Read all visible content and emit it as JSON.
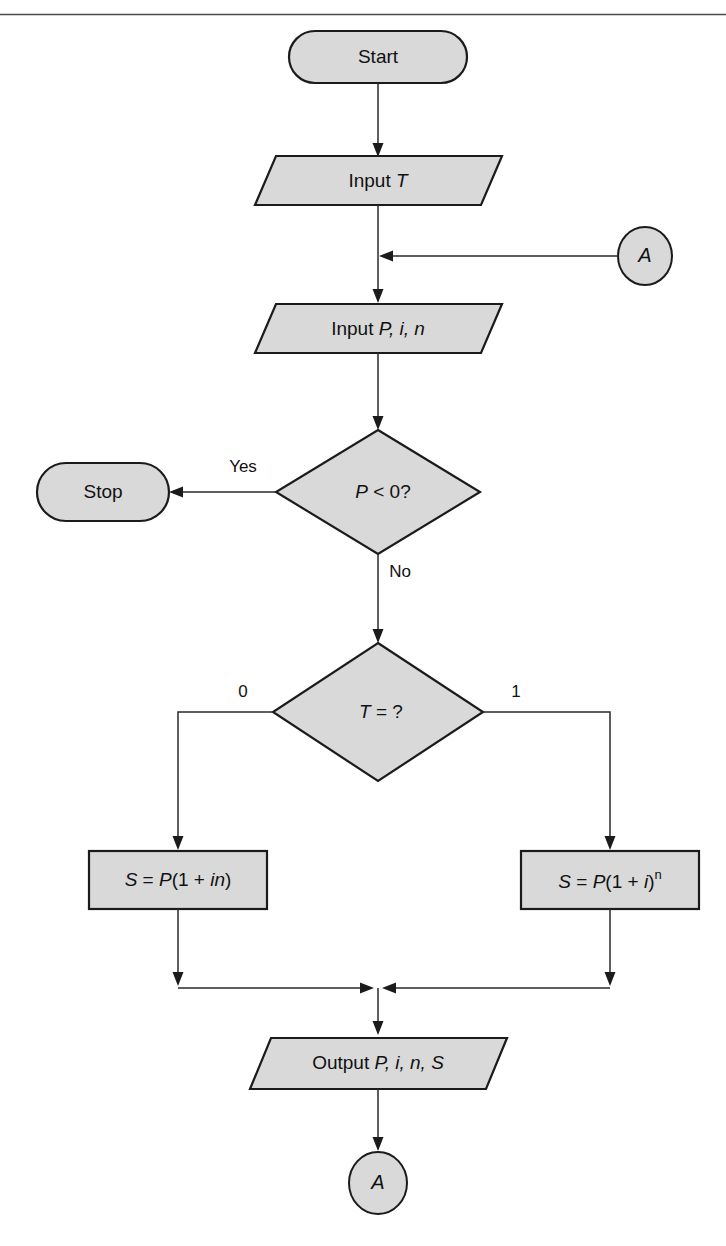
{
  "diagram": {
    "type": "flowchart",
    "fill_color": "#d9d9d9",
    "line_color": "#1b1b1b",
    "background_color": "#ffffff",
    "top_rule": true
  },
  "nodes": {
    "start": {
      "label": "Start",
      "shape": "terminator"
    },
    "input_t": {
      "label_prefix": "Input ",
      "label_var": "T",
      "shape": "parallelogram"
    },
    "connector_a_top": {
      "label": "A",
      "shape": "circle"
    },
    "input_pin": {
      "label_prefix": "Input ",
      "label_vars": "P, i, n",
      "shape": "parallelogram"
    },
    "decision_p": {
      "label_var": "P",
      "label_rest": " < 0?",
      "shape": "diamond"
    },
    "stop": {
      "label": "Stop",
      "shape": "terminator"
    },
    "decision_t": {
      "label_var": "T",
      "label_rest": " = ?",
      "shape": "diamond"
    },
    "simple_interest": {
      "lhs": "S",
      "eq": " = ",
      "rhs_var": "P",
      "rhs_rest_open": "(1 + ",
      "rhs_italic": "in",
      "rhs_rest_close": ")",
      "shape": "process"
    },
    "compound_interest": {
      "lhs": "S",
      "eq": " = ",
      "rhs_var": "P",
      "rhs_rest_open": "(1 + ",
      "rhs_italic": "i",
      "rhs_rest_close": ")",
      "exponent": "n",
      "shape": "process"
    },
    "output": {
      "label_prefix": "Output ",
      "label_vars": "P, i, n, S",
      "shape": "parallelogram"
    },
    "connector_a_bottom": {
      "label": "A",
      "shape": "circle"
    }
  },
  "edges": {
    "yes_label": "Yes",
    "no_label": "No",
    "branch_zero_label": "0",
    "branch_one_label": "1"
  }
}
